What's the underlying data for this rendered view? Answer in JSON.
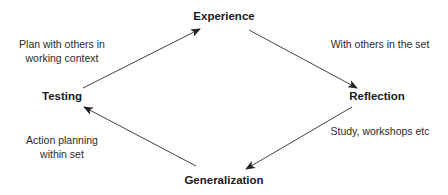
{
  "diagram": {
    "type": "cycle",
    "nodes": {
      "experience": "Experience",
      "reflection": "Reflection",
      "generalization": "Generalization",
      "testing": "Testing"
    },
    "edges": [
      {
        "from": "testing",
        "to": "experience",
        "label_lines": [
          "Plan with others in",
          "working context"
        ]
      },
      {
        "from": "experience",
        "to": "reflection",
        "label_lines": [
          "With others in the set"
        ]
      },
      {
        "from": "reflection",
        "to": "generalization",
        "label_lines": [
          "Study, workshops etc"
        ]
      },
      {
        "from": "generalization",
        "to": "testing",
        "label_lines": [
          "Action planning",
          "within set"
        ]
      }
    ],
    "colors": {
      "arrow": "#333333",
      "text": "#1a1a1a"
    }
  }
}
